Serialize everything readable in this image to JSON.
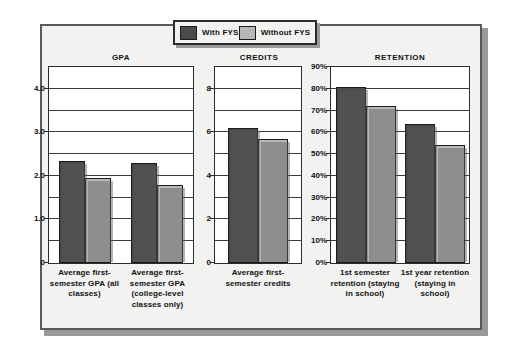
{
  "legend": {
    "entries": [
      {
        "label": "With FYS",
        "color": "#4a4a4a"
      },
      {
        "label": "Without FYS",
        "color": "#b8b8b8"
      }
    ]
  },
  "colors": {
    "with_fys": "#4a4a4a",
    "without_fys": "#b8b8b8",
    "background": "#f2f2f0",
    "frame_border": "#5a5a58",
    "axis": "#2b2b2b",
    "text": "#111111"
  },
  "panels": [
    {
      "title": "GPA",
      "y_ticks": [
        "4.0",
        "3.0",
        "2.0",
        "1.0",
        "0"
      ],
      "x_labels": [
        "Average first-semester GPA (all classes)",
        "Average first-semester GPA (college-level classes only)"
      ]
    },
    {
      "title": "CREDITS",
      "y_ticks": [
        "8",
        "6",
        "4",
        "2",
        "0"
      ],
      "x_labels": [
        "Average first-semester credits"
      ]
    },
    {
      "title": "RETENTION",
      "y_ticks": [
        "90%",
        "80%",
        "70%",
        "60%",
        "50%",
        "40%",
        "30%",
        "20%",
        "10%",
        "0%"
      ],
      "x_labels": [
        "1st semester retention (staying in school)",
        "1st year retention (staying in school)"
      ]
    }
  ],
  "chart_data": [
    {
      "type": "bar",
      "title": "GPA",
      "categories": [
        "Average first-semester GPA (all classes)",
        "Average first-semester GPA (college-level classes only)"
      ],
      "series": [
        {
          "name": "With FYS",
          "values": [
            2.35,
            2.3
          ]
        },
        {
          "name": "Without FYS",
          "values": [
            1.95,
            1.8
          ]
        }
      ],
      "xlabel": "",
      "ylabel": "",
      "ylim": [
        0,
        4.5
      ],
      "yticks": [
        0,
        1.0,
        2.0,
        3.0,
        4.0
      ],
      "gridlines": [
        0.5,
        1.0,
        1.5,
        2.0,
        2.5,
        3.0,
        3.5,
        4.0
      ],
      "grid": true,
      "legend_position": "top-center"
    },
    {
      "type": "bar",
      "title": "CREDITS",
      "categories": [
        "Average first-semester credits"
      ],
      "series": [
        {
          "name": "With FYS",
          "values": [
            6.2
          ]
        },
        {
          "name": "Without FYS",
          "values": [
            5.7
          ]
        }
      ],
      "xlabel": "",
      "ylabel": "",
      "ylim": [
        0,
        9
      ],
      "yticks": [
        0,
        2,
        4,
        6,
        8
      ],
      "gridlines": [
        1,
        2,
        3,
        4,
        5,
        6,
        7,
        8
      ],
      "grid": true,
      "legend_position": "top-center"
    },
    {
      "type": "bar",
      "title": "RETENTION",
      "categories": [
        "1st semester retention (staying in school)",
        "1st year retention (staying in school)"
      ],
      "series": [
        {
          "name": "With FYS",
          "values": [
            81,
            64
          ]
        },
        {
          "name": "Without FYS",
          "values": [
            72,
            54
          ]
        }
      ],
      "xlabel": "",
      "ylabel": "",
      "unit": "%",
      "ylim": [
        0,
        90
      ],
      "yticks": [
        0,
        10,
        20,
        30,
        40,
        50,
        60,
        70,
        80,
        90
      ],
      "gridlines": [
        10,
        20,
        30,
        40,
        50,
        60,
        70,
        80
      ],
      "grid": true,
      "legend_position": "top-center"
    }
  ]
}
